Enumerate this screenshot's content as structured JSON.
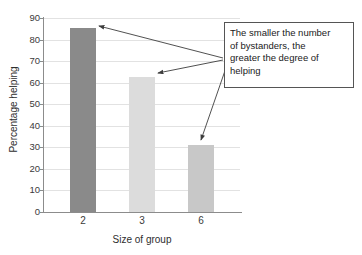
{
  "chart_data": {
    "type": "bar",
    "title": "",
    "subtitle": "",
    "categories": [
      "2",
      "3",
      "6"
    ],
    "values": [
      85.5,
      62.5,
      31
    ],
    "series": [
      {
        "name": "Percentage helping",
        "values": [
          85.5,
          62.5,
          31
        ]
      }
    ],
    "xlabel": "Size of group",
    "ylabel": "Percentage helping",
    "ylim": [
      0,
      90
    ],
    "ytick_step": 10,
    "yticks": [
      0,
      10,
      20,
      30,
      40,
      50,
      60,
      70,
      80,
      90
    ],
    "ytick_labels": [
      "0",
      "10",
      "20",
      "30",
      "40",
      "50",
      "60",
      "70",
      "80",
      "90"
    ],
    "grid": true,
    "grid_axis": "y",
    "legend": false,
    "legend_position": "none",
    "bar_colors": [
      "#8a8a8a",
      "#dcdcdc",
      "#c8c8c8"
    ],
    "annotations": [
      {
        "text": "The smaller the number of bystanders, the greater the degree of helping",
        "lines": [
          "The smaller the number",
          "of bystanders, the",
          "greater the degree of",
          "helping"
        ],
        "points_to": [
          "2",
          "3",
          "6"
        ]
      }
    ]
  },
  "colors": {
    "background": "#ffffff",
    "axis": "#8c8c8c",
    "gridline": "#e2e2e2",
    "text": "#2e2e2e",
    "annotation_border": "#555555",
    "arrow": "#3d3d3d"
  }
}
